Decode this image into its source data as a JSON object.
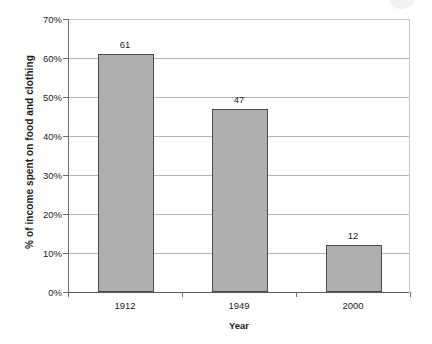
{
  "chart_data": {
    "type": "bar",
    "title": "",
    "categories": [
      "1912",
      "1949",
      "2000"
    ],
    "values": [
      61,
      47,
      12
    ],
    "value_labels": [
      "61",
      "47",
      "12"
    ],
    "xlabel": "Year",
    "ylabel": "% of income spent on food and clothing",
    "ylim": [
      0,
      70
    ],
    "ytick_values": [
      0,
      10,
      20,
      30,
      40,
      50,
      60,
      70
    ],
    "ytick_labels": [
      "0%",
      "10%",
      "20%",
      "30%",
      "40%",
      "50%",
      "60%",
      "70%"
    ],
    "grid": "horizontal",
    "legend": "none",
    "bar_fill_color": "#afafaf",
    "bar_border_color": "#4a4a4a",
    "gridline_color": "#b4b4b4",
    "axis_color": "#6f6f6f",
    "text_color": "#1c1c1c",
    "background_color": "#ffffff"
  }
}
